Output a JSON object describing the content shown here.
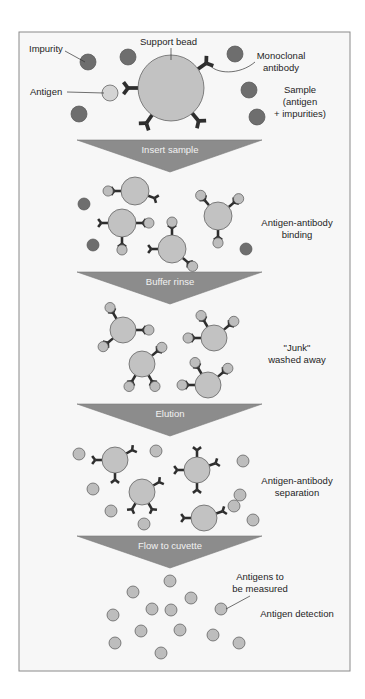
{
  "colors": {
    "frame_bg": "#f7f7f7",
    "frame_border": "#8a8a8a",
    "bead_fill": "#c2c2c2",
    "antigen_fill": "#bdbdbd",
    "antigen_first_fill": "#d4d4d4",
    "impurity_fill": "#6e6e6e",
    "antibody": "#2e2e2e",
    "outline": "#555555",
    "arrow_fill": "#8c8c8c",
    "arrow_text": "#f2f2f2",
    "label_text": "#1e1e1e"
  },
  "frame": {
    "x": 19,
    "y": 32,
    "w": 331,
    "h": 639
  },
  "steps": [
    {
      "label": "Insert sample",
      "top": 140,
      "apex": 172
    },
    {
      "label": "Buffer rinse",
      "top": 272,
      "apex": 304
    },
    {
      "label": "Elution",
      "top": 404,
      "apex": 436
    },
    {
      "label": "Flow to cuvette",
      "top": 536,
      "apex": 568
    }
  ],
  "arrow_geom": {
    "left": 77,
    "right": 262,
    "apex_x": 170
  },
  "stage_labels": [
    {
      "id": "sample",
      "lines": [
        "Sample",
        "(antigen",
        "+ impurities)"
      ],
      "x": 300,
      "y": 93
    },
    {
      "id": "binding",
      "lines": [
        "Antigen-antibody",
        "binding"
      ],
      "x": 297,
      "y": 226
    },
    {
      "id": "washed",
      "lines": [
        "\"Junk\"",
        "washed away"
      ],
      "x": 297,
      "y": 351
    },
    {
      "id": "separation",
      "lines": [
        "Antigen-antibody",
        "separation"
      ],
      "x": 297,
      "y": 484
    },
    {
      "id": "detection",
      "lines": [
        "Antigen detection"
      ],
      "x": 297,
      "y": 617
    }
  ],
  "callouts": [
    {
      "id": "impurity",
      "text": "Impurity",
      "x": 29,
      "y": 52,
      "line": [
        65,
        51,
        85,
        62
      ]
    },
    {
      "id": "support-bead",
      "text": "Support  bead",
      "x": 140,
      "y": 45,
      "line": [
        171,
        48,
        171,
        60
      ]
    },
    {
      "id": "monoclonal",
      "lines": [
        "Monoclonal",
        "antibody"
      ],
      "x": 253,
      "y": 59,
      "curve": "M208,63 C215,75 240,75 255,62"
    },
    {
      "id": "antigen",
      "text": "Antigen",
      "x": 30,
      "y": 95,
      "line": [
        67,
        92,
        104,
        93
      ]
    },
    {
      "id": "antigens-measured",
      "lines": [
        "Antigens to",
        "be measured"
      ],
      "x": 232,
      "y": 580,
      "line": [
        250,
        596,
        226,
        609
      ]
    }
  ],
  "scene1": {
    "bead": {
      "cx": 171,
      "cy": 88,
      "r": 33
    },
    "antigen": {
      "cx": 110,
      "cy": 93,
      "r": 8
    },
    "impurities": [
      [
        88,
        62,
        8
      ],
      [
        128,
        57,
        8
      ],
      [
        235,
        54,
        8
      ],
      [
        249,
        90,
        8
      ],
      [
        257,
        117,
        8
      ],
      [
        79,
        114,
        8
      ]
    ]
  },
  "complexes": [
    {
      "stage": "binding",
      "cx": 135,
      "cy": 191,
      "r": 14,
      "arms": [
        [
          180,
          true
        ],
        [
          20,
          false
        ]
      ]
    },
    {
      "stage": "binding",
      "cx": 122,
      "cy": 223,
      "r": 14,
      "arms": [
        [
          180,
          false
        ],
        [
          0,
          true
        ],
        [
          90,
          true
        ]
      ]
    },
    {
      "stage": "binding",
      "cx": 218,
      "cy": 216,
      "r": 14,
      "arms": [
        [
          -130,
          true
        ],
        [
          -40,
          true
        ],
        [
          90,
          true
        ]
      ]
    },
    {
      "stage": "binding",
      "cx": 172,
      "cy": 249,
      "r": 14,
      "arms": [
        [
          180,
          false
        ],
        [
          -90,
          true
        ],
        [
          40,
          true
        ]
      ]
    },
    {
      "stage": "washed",
      "cx": 123,
      "cy": 330,
      "r": 13,
      "arms": [
        [
          -120,
          true
        ],
        [
          0,
          true
        ],
        [
          140,
          true
        ]
      ]
    },
    {
      "stage": "washed",
      "cx": 214,
      "cy": 338,
      "r": 13,
      "arms": [
        [
          -120,
          true
        ],
        [
          -40,
          true
        ],
        [
          180,
          true
        ]
      ]
    },
    {
      "stage": "washed",
      "cx": 142,
      "cy": 364,
      "r": 13,
      "arms": [
        [
          -40,
          true
        ],
        [
          120,
          true
        ],
        [
          60,
          true
        ]
      ]
    },
    {
      "stage": "washed",
      "cx": 208,
      "cy": 385,
      "r": 13,
      "arms": [
        [
          -120,
          true
        ],
        [
          -40,
          true
        ],
        [
          180,
          true
        ]
      ]
    },
    {
      "stage": "separation",
      "cx": 115,
      "cy": 460,
      "r": 13,
      "arms": [
        [
          180,
          false
        ],
        [
          -30,
          false
        ],
        [
          90,
          false
        ]
      ]
    },
    {
      "stage": "separation",
      "cx": 197,
      "cy": 470,
      "r": 13,
      "arms": [
        [
          -90,
          false
        ],
        [
          180,
          false
        ],
        [
          -20,
          false
        ],
        [
          90,
          false
        ]
      ]
    },
    {
      "stage": "separation",
      "cx": 142,
      "cy": 492,
      "r": 13,
      "arms": [
        [
          -30,
          false
        ],
        [
          120,
          false
        ],
        [
          60,
          false
        ]
      ]
    },
    {
      "stage": "separation",
      "cx": 204,
      "cy": 518,
      "r": 13,
      "arms": [
        [
          180,
          false
        ],
        [
          -20,
          false
        ]
      ]
    }
  ],
  "free_particles": {
    "binding_impurities": [
      [
        84,
        204,
        6
      ],
      [
        93,
        245,
        6
      ],
      [
        246,
        249,
        6
      ]
    ],
    "washed": [],
    "separation_antigens": [
      [
        79,
        454,
        6
      ],
      [
        156,
        451,
        6
      ],
      [
        243,
        461,
        6
      ],
      [
        93,
        489,
        6
      ],
      [
        240,
        495,
        6
      ],
      [
        234,
        506,
        6
      ],
      [
        111,
        511,
        6
      ],
      [
        144,
        524,
        6
      ],
      [
        253,
        520,
        6
      ]
    ],
    "separation_bottom": [
      [
        111,
        511,
        6
      ],
      [
        144,
        524,
        6
      ]
    ],
    "detection_antigens": [
      [
        170,
        581,
        6
      ],
      [
        133,
        592,
        6
      ],
      [
        191,
        598,
        6
      ],
      [
        152,
        609,
        6
      ],
      [
        171,
        610,
        6
      ],
      [
        221,
        609,
        6
      ],
      [
        113,
        615,
        6
      ],
      [
        141,
        631,
        6
      ],
      [
        180,
        630,
        6
      ],
      [
        213,
        635,
        6
      ],
      [
        115,
        643,
        6
      ],
      [
        239,
        643,
        6
      ],
      [
        161,
        653,
        6
      ]
    ]
  }
}
